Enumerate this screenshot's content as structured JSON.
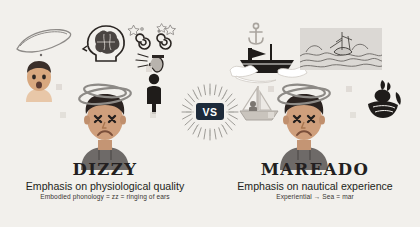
{
  "slide": {
    "background_color": "#f2f0ec",
    "layout": "two-column-comparison",
    "divider": "vs-badge-center"
  },
  "center": {
    "badge_label": "VS",
    "badge_color": "#1d2a3a",
    "badge_text_color": "#ffffff",
    "icon": "sunburst-rays"
  },
  "left": {
    "term": "DIZZY",
    "subtitle": "Emphasis on physiological quality",
    "gloss": "Embodied phonology = zz = ringing of ears",
    "language": "English",
    "icons": [
      {
        "name": "motion-squiggle-icon",
        "desc": "looping scribble line"
      },
      {
        "name": "head-brain-icon",
        "desc": "side profile head with brain"
      },
      {
        "name": "spiral-stars-icon",
        "desc": "two spirals with stars"
      },
      {
        "name": "ear-ringing-icon",
        "desc": "ear with sound lines"
      },
      {
        "name": "worried-face-icon",
        "desc": "person with open mouth"
      },
      {
        "name": "standing-person-icon",
        "desc": "dark silhouette figure"
      },
      {
        "name": "dizzy-character",
        "desc": "person with X eyes and swirls overhead"
      }
    ]
  },
  "right": {
    "term": "MAREADO",
    "subtitle": "Emphasis on nautical experience",
    "gloss": "Experiential → Sea = mar",
    "language": "Spanish",
    "icons": [
      {
        "name": "sinking-ship-icon",
        "desc": "dark ship in waves"
      },
      {
        "name": "stormy-sea-engraving-icon",
        "desc": "engraved ship on rough waves"
      },
      {
        "name": "anchor-icon",
        "desc": "small anchor"
      },
      {
        "name": "sailboat-icon",
        "desc": "small sailboat with person"
      },
      {
        "name": "ship-figurehead-icon",
        "desc": "mermaid prow figurehead"
      },
      {
        "name": "dizzy-character",
        "desc": "person with X eyes and swirls overhead"
      }
    ]
  },
  "colors": {
    "background": "#f2f0ec",
    "ink": "#231f20",
    "navy": "#1d2a3a",
    "skin": "#c89a78",
    "shirt": "#6e6a68",
    "swirl": "#8d8a86"
  }
}
